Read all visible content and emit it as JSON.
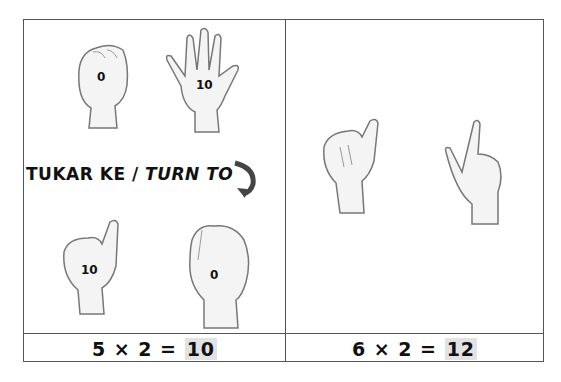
{
  "left_panel": {
    "top_hands": [
      {
        "shape": "fist",
        "label": "0"
      },
      {
        "shape": "open-hand",
        "label": "10"
      }
    ],
    "instruction": {
      "malay": "TUKAR KE",
      "separator": " / ",
      "english": "TURN TO"
    },
    "bottom_hands": [
      {
        "shape": "thumb-up",
        "label": "10"
      },
      {
        "shape": "fist",
        "label": "0"
      }
    ],
    "equation": {
      "lhs": "5 × 2 = ",
      "result": "10"
    }
  },
  "right_panel": {
    "hands": [
      {
        "shape": "thumb-up",
        "label": ""
      },
      {
        "shape": "index-up",
        "label": ""
      }
    ],
    "equation": {
      "lhs": "6 × 2 = ",
      "result": "12"
    }
  },
  "colors": {
    "border": "#555555",
    "highlight": "#e2e2e2",
    "arrow": "#444444",
    "skin_shade": "#cfcfcf"
  }
}
